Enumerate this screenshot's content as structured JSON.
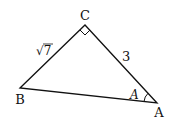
{
  "diagram": {
    "type": "right-triangle",
    "vertices": {
      "A": {
        "label": "A",
        "x": 157,
        "y": 103
      },
      "B": {
        "label": "B",
        "x": 20,
        "y": 88
      },
      "C": {
        "label": "C",
        "x": 85,
        "y": 25
      }
    },
    "sides": {
      "BC": {
        "label": "√7"
      },
      "CA": {
        "label": "3"
      }
    },
    "angle_label": "A",
    "right_angle_at": "C",
    "stroke_color": "#111111"
  }
}
